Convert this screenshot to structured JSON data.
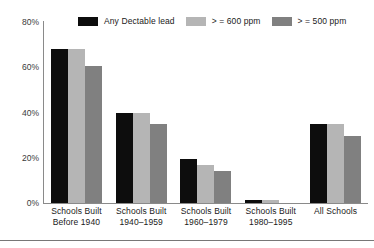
{
  "chart_data": {
    "type": "bar",
    "title": "",
    "xlabel": "",
    "ylabel": "",
    "ylim": [
      0,
      80
    ],
    "ytick_labels": [
      "80%",
      "60%",
      "40%",
      "20%",
      "0%"
    ],
    "ytick_values": [
      80,
      60,
      40,
      20,
      0
    ],
    "grid": false,
    "legend_position": "top",
    "categories": [
      "Schools Built Before 1940",
      "Schools Built 1940–1959",
      "Schools Built 1960–1979",
      "Schools Built 1980–1995",
      "All Schools"
    ],
    "category_lines": [
      [
        "Schools Built",
        "Before 1940"
      ],
      [
        "Schools Built",
        "1940–1959"
      ],
      [
        "Schools Built",
        "1960–1979"
      ],
      [
        "Schools Built",
        "1980–1995"
      ],
      [
        "All Schools",
        ""
      ]
    ],
    "series": [
      {
        "name": "Any Dectable lead",
        "color": "#0d0d0d",
        "values": [
          68,
          40,
          19.5,
          1.5,
          35
        ]
      },
      {
        "name": "> = 600 ppm",
        "color": "#b5b5b5",
        "values": [
          68,
          40,
          17,
          1.5,
          35
        ]
      },
      {
        "name": "> = 500 ppm",
        "color": "#808080",
        "values": [
          60.5,
          35,
          14,
          0,
          29.5
        ]
      }
    ]
  },
  "legend": {
    "items": [
      {
        "label": "Any Dectable lead",
        "color": "#0d0d0d"
      },
      {
        "label": "> = 600 ppm",
        "color": "#b5b5b5"
      },
      {
        "label": "> = 500 ppm",
        "color": "#808080"
      }
    ]
  },
  "colors": {
    "axis": "#8a8a8a",
    "text": "#1a1a1a",
    "tick_text": "#3a3a3a",
    "rule": "#777777",
    "background": "#ffffff"
  }
}
